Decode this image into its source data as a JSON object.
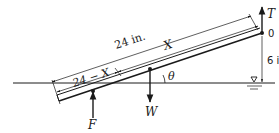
{
  "diagram": {
    "type": "free-body diagram of inclined bar partially submerged",
    "colors": {
      "ink": "#1a1a1a",
      "background": "#ffffff"
    },
    "labels": {
      "total_length": "24 in.",
      "upper_segment": "X",
      "submerged_segment": "24 − X",
      "height": "6 in.",
      "angle": "θ",
      "pivot": "0",
      "tension": "T",
      "weight": "W",
      "buoyant_force": "F"
    },
    "symbols": {
      "water_surface": "free-surface-triangle"
    }
  }
}
